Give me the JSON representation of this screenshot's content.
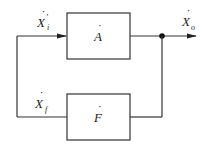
{
  "diagram": {
    "type": "feedback-block-diagram",
    "blocks": [
      {
        "id": "A",
        "label": "A",
        "dot": true,
        "role": "forward-gain"
      },
      {
        "id": "F",
        "label": "F",
        "dot": true,
        "role": "feedback-gain"
      }
    ],
    "signals": {
      "input": {
        "symbol": "X",
        "prime": "′",
        "subscript": "i"
      },
      "output": {
        "symbol": "X",
        "subscript": "o"
      },
      "feedback": {
        "symbol": "X",
        "subscript": "f"
      }
    },
    "dot_glyph": "·",
    "colors": {
      "line": "#333333",
      "background": "#ffffff",
      "text": "#222222"
    }
  }
}
